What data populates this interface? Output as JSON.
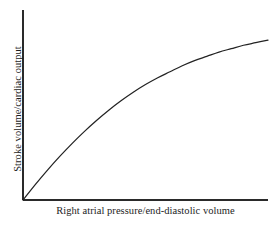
{
  "chart_data": {
    "type": "line",
    "title": "",
    "subtitle": "",
    "xlabel": "Right atrial pressure/end-diastolic volume",
    "ylabel": "Stroke volume/cardiac output",
    "grid": false,
    "legend": false,
    "legend_position": "none",
    "annotations": [],
    "xlim": [
      0,
      100
    ],
    "ylim": [
      0,
      100
    ],
    "xticks": [],
    "yticks": [],
    "xticklabels": [],
    "yticklabels": [],
    "axis_color": "#2a2a2a",
    "curve_color": "#232323",
    "background_color": "#ffffff",
    "series": [
      {
        "name": "Frank-Starling curve",
        "x": [
          0,
          5,
          10,
          15,
          20,
          25,
          30,
          35,
          40,
          45,
          50,
          55,
          60,
          65,
          70,
          75,
          80,
          85,
          90,
          95,
          100
        ],
        "y": [
          0,
          9,
          17.5,
          25.5,
          33,
          40,
          46.5,
          52.5,
          58,
          63,
          67.5,
          71.5,
          75,
          78.5,
          81.5,
          84,
          86.5,
          88.5,
          90.5,
          92,
          93.5
        ]
      }
    ]
  }
}
